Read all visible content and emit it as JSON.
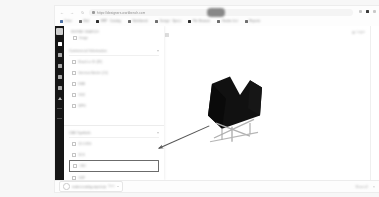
{
  "browser": {
    "back_icon": "back-arrow-icon",
    "forward_icon": "forward-arrow-icon",
    "reload_icon": "reload-icon",
    "lock_icon": "lock-icon",
    "url": "https://designers.workbench.com",
    "url_placeholder": "Search Google or type a URL",
    "extensions_icon": "extensions-icon",
    "profile_icon": "profile-icon",
    "menu_icon": "kebab-menu-icon",
    "bookmarks": [
      {
        "label": "Drive",
        "icon": "drive-icon"
      },
      {
        "label": "Mail",
        "icon": "mail-icon"
      },
      {
        "label": "ERP · Catalog",
        "icon": "erp-icon"
      },
      {
        "label": "Workbench",
        "icon": "workbench-icon"
      },
      {
        "label": "Design · Specs",
        "icon": "design-icon"
      },
      {
        "label": "File Browser",
        "icon": "folder-icon"
      },
      {
        "label": "Vendor List",
        "icon": "vendor-icon"
      },
      {
        "label": "Reports",
        "icon": "reports-icon"
      }
    ]
  },
  "rail": {
    "logo_icon": "app-logo-icon",
    "items": [
      {
        "icon": "grid-icon",
        "active": true
      },
      {
        "icon": "layers-icon",
        "active": false
      },
      {
        "icon": "cube-icon",
        "active": false
      },
      {
        "icon": "tag-icon",
        "active": false
      },
      {
        "icon": "list-icon",
        "active": false
      },
      {
        "icon": "upload-icon",
        "active": false
      }
    ]
  },
  "canvas": {
    "toolbar": [
      {
        "icon": "cursor-tool-icon"
      },
      {
        "icon": "pan-tool-icon"
      },
      {
        "icon": "zoom-tool-icon"
      },
      {
        "icon": "measure-tool-icon"
      },
      {
        "icon": "crop-tool-icon"
      },
      {
        "icon": "settings-tool-icon"
      }
    ],
    "login_label": "Login",
    "login_icon": "user-circle-icon"
  },
  "panel": {
    "title": "Refine Search",
    "top_item": {
      "label": "Image",
      "bullet_icon": "checkbox-icon"
    },
    "sections": [
      {
        "title": "Commercial Information",
        "collapse_icon": "chevron-down-icon",
        "options": [
          {
            "label": "Brand or ID (89)",
            "bullet_icon": "checkbox-icon",
            "highlight": false
          },
          {
            "label": "Identical Article (24)",
            "bullet_icon": "checkbox-icon",
            "highlight": false
          },
          {
            "label": "EAN",
            "bullet_icon": "checkbox-icon",
            "highlight": false
          },
          {
            "label": "SKU",
            "bullet_icon": "checkbox-icon",
            "highlight": false
          },
          {
            "label": "MPN",
            "bullet_icon": "checkbox-icon",
            "highlight": false
          }
        ]
      },
      {
        "title": "CAD Symbols",
        "collapse_icon": "chevron-down-icon",
        "options": [
          {
            "label": "2D DWG",
            "bullet_icon": "checkbox-icon",
            "highlight": false
          },
          {
            "label": "3DS",
            "bullet_icon": "checkbox-icon",
            "highlight": false
          },
          {
            "label": "OBJ",
            "bullet_icon": "checkbox-icon",
            "highlight": true
          },
          {
            "label": "SKP",
            "bullet_icon": "checkbox-icon",
            "highlight": false
          }
        ]
      }
    ],
    "annotation": {
      "type": "arrow",
      "target": "OBJ",
      "color": "#555555"
    }
  },
  "downloads": {
    "file_name": "product-catalog-export.zip",
    "file_status": "Done",
    "caret_icon": "chevron-down-icon",
    "file_icon": "download-progress-icon",
    "show_all_label": "Show all",
    "close_icon": "close-icon"
  },
  "colors": {
    "rail_bg": "#161616",
    "panel_bg": "#ffffff",
    "canvas_bg": "#ffffff",
    "highlight_border": "#6b6b6b",
    "annotation": "#555555"
  }
}
